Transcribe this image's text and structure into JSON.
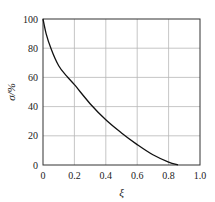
{
  "chart_data": {
    "type": "line",
    "title": "",
    "xlabel": "ξ",
    "ylabel": "σ/%",
    "xlim": [
      0,
      1.0
    ],
    "ylim": [
      0,
      100
    ],
    "grid": true,
    "legend": null,
    "x_ticks": [
      "0",
      "0.2",
      "0.4",
      "0.6",
      "0.8",
      "1.0"
    ],
    "y_ticks": [
      "0",
      "20",
      "40",
      "60",
      "80",
      "100"
    ],
    "series": [
      {
        "name": "σ",
        "x": [
          0,
          0.02,
          0.05,
          0.1,
          0.15,
          0.2,
          0.3,
          0.4,
          0.5,
          0.6,
          0.7,
          0.8,
          0.86
        ],
        "values": [
          100,
          90,
          80,
          68,
          61,
          55,
          42,
          31,
          22,
          14,
          7,
          2,
          0
        ]
      }
    ]
  }
}
